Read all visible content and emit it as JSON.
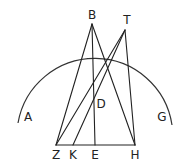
{
  "diagram": {
    "type": "geometry-figure",
    "stroke_color": "#222222",
    "background": "#ffffff",
    "points": {
      "B": {
        "label": "B",
        "x": 92,
        "y": 24
      },
      "T": {
        "label": "T",
        "x": 125,
        "y": 30
      },
      "D": {
        "label": "D",
        "x": 94,
        "y": 96
      },
      "Z": {
        "label": "Z",
        "x": 56,
        "y": 145
      },
      "K": {
        "label": "K",
        "x": 73,
        "y": 145
      },
      "E": {
        "label": "E",
        "x": 94,
        "y": 145
      },
      "H": {
        "label": "H",
        "x": 135,
        "y": 145
      },
      "A": {
        "label": "A"
      },
      "G": {
        "label": "G"
      }
    },
    "segments": [
      [
        "Z",
        "H"
      ],
      [
        "Z",
        "B"
      ],
      [
        "B",
        "E"
      ],
      [
        "B",
        "H"
      ],
      [
        "Z",
        "T"
      ],
      [
        "K",
        "T"
      ],
      [
        "T",
        "H"
      ]
    ],
    "arc": {
      "label": "circle arc AG through B and T"
    }
  }
}
